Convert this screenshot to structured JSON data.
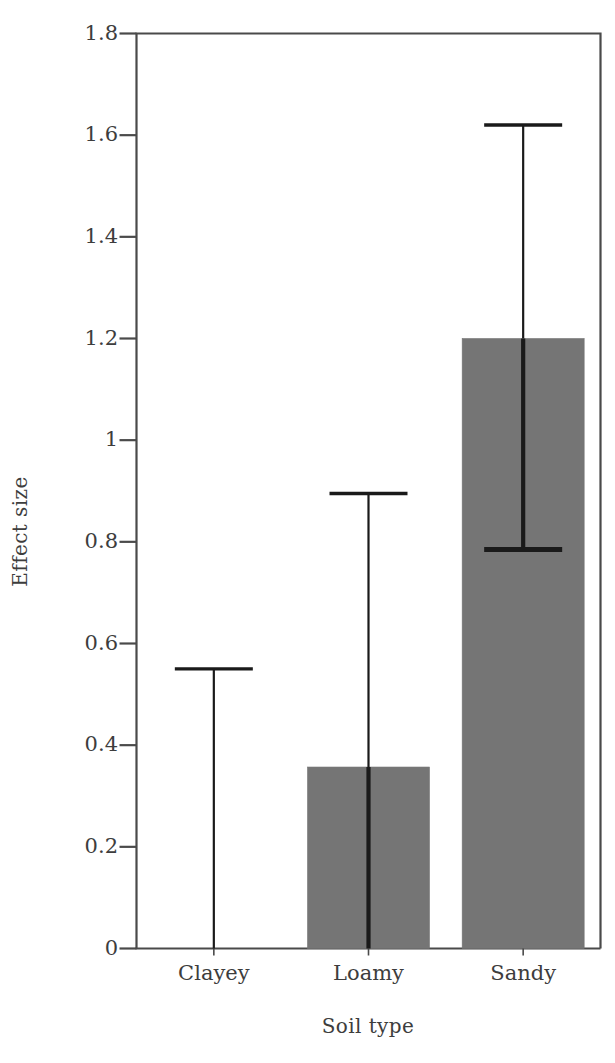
{
  "chart_data": {
    "type": "bar",
    "title": "",
    "xlabel": "Soil type",
    "ylabel": "Effect size",
    "categories": [
      "Clayey",
      "Loamy",
      "Sandy"
    ],
    "values": [
      0,
      0.357,
      1.2
    ],
    "error_upper": [
      0.55,
      0.895,
      1.62
    ],
    "error_lower": [
      0,
      0,
      0.785
    ],
    "ylim": [
      0,
      1.8
    ],
    "yticks": [
      0,
      0.2,
      0.4,
      0.6,
      0.8,
      1,
      1.2,
      1.4,
      1.6,
      1.8
    ],
    "ytick_labels": [
      "0",
      "0.2",
      "0.4",
      "0.6",
      "0.8",
      "1",
      "1.2",
      "1.4",
      "1.6",
      "1.8"
    ],
    "grid": false,
    "legend": "none",
    "series": [
      {
        "name": "Effect size",
        "values": [
          0,
          0.357,
          1.2
        ],
        "error_upper": [
          0.55,
          0.895,
          1.62
        ],
        "error_lower": [
          0,
          0,
          0.785
        ]
      }
    ],
    "bar_color": "#757575",
    "axis_color": "#4a4a4a",
    "error_bar_color": "#1a1a1a",
    "background": "#ffffff"
  },
  "axis": {
    "y_title": "Effect size",
    "x_title": "Soil type"
  }
}
